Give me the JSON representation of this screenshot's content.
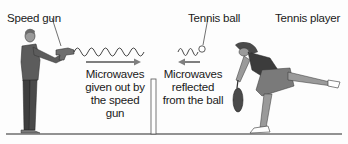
{
  "diagram": {
    "type": "labeled-illustration",
    "labels": {
      "speed_gun": "Speed gun",
      "tennis_ball": "Tennis ball",
      "tennis_player": "Tennis player"
    },
    "captions": {
      "emitted": [
        "Microwaves",
        "given out by",
        "the speed gun"
      ],
      "reflected": [
        "Microwaves",
        "reflected",
        "from the ball"
      ]
    },
    "arrows": {
      "emitted_direction": "right",
      "reflected_direction": "left",
      "arrow_color": "#7f7f7f"
    },
    "colors": {
      "background": "#fdfdfd",
      "ground": "#6e6e6e",
      "figure_dark": "#4a4a4a",
      "figure_mid": "#8a8a8a",
      "text": "#1a1a1a"
    }
  }
}
